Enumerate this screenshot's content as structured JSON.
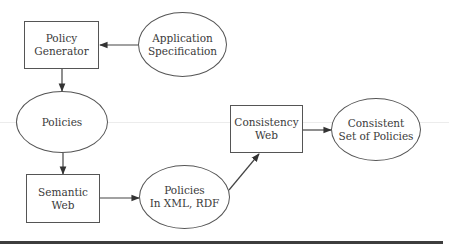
{
  "diagram": {
    "nodes": [
      {
        "id": "policy-generator",
        "shape": "box",
        "label": "Policy\nGenerator",
        "x": 24,
        "y": 21,
        "w": 75,
        "h": 48
      },
      {
        "id": "application-specification",
        "shape": "ellipse",
        "label": "Application\nSpecification",
        "x": 138,
        "y": 12,
        "w": 89,
        "h": 65
      },
      {
        "id": "policies",
        "shape": "ellipse",
        "label": "Policies",
        "x": 16,
        "y": 91,
        "w": 92,
        "h": 62
      },
      {
        "id": "semantic-web",
        "shape": "box",
        "label": "Semantic\nWeb",
        "x": 26,
        "y": 174,
        "w": 74,
        "h": 49
      },
      {
        "id": "policies-xml-rdf",
        "shape": "ellipse",
        "label": "Policies\nIn XML, RDF",
        "x": 139,
        "y": 165,
        "w": 91,
        "h": 64
      },
      {
        "id": "consistency-web",
        "shape": "box",
        "label": "Consistency\nWeb",
        "x": 230,
        "y": 105,
        "w": 73,
        "h": 48
      },
      {
        "id": "consistent-set",
        "shape": "ellipse",
        "label": "Consistent\nSet of Policies",
        "x": 331,
        "y": 98,
        "w": 90,
        "h": 63
      }
    ],
    "edges": [
      {
        "from": "application-specification",
        "to": "policy-generator",
        "x1": 138,
        "y1": 45,
        "x2": 100,
        "y2": 45
      },
      {
        "from": "policy-generator",
        "to": "policies",
        "x1": 62,
        "y1": 69,
        "x2": 62,
        "y2": 91
      },
      {
        "from": "policies",
        "to": "semantic-web",
        "x1": 63,
        "y1": 153,
        "x2": 63,
        "y2": 174
      },
      {
        "from": "semantic-web",
        "to": "policies-xml-rdf",
        "x1": 100,
        "y1": 198,
        "x2": 139,
        "y2": 198
      },
      {
        "from": "policies-xml-rdf",
        "to": "consistency-web",
        "x1": 229,
        "y1": 190,
        "x2": 259,
        "y2": 154
      },
      {
        "from": "consistency-web",
        "to": "consistent-set",
        "x1": 303,
        "y1": 130,
        "x2": 331,
        "y2": 130
      }
    ],
    "colors": {
      "stroke": "#555555",
      "text": "#3a3a3a",
      "rule": "#3d3d3d"
    }
  }
}
